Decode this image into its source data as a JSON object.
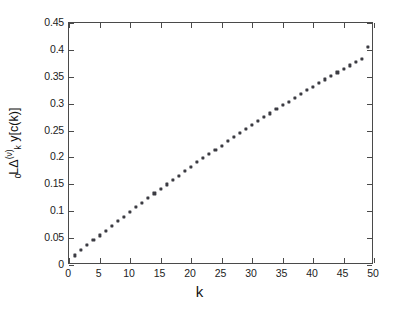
{
  "chart_data": {
    "type": "scatter",
    "title": "",
    "xlabel": "k",
    "ylabel": "L0 delta_k^(v) y[c(k)]",
    "ylabel_parts": {
      "pre_subscript": "0",
      "operator": "Δ",
      "operator_subscript": "k",
      "operator_superscript": "(ν)",
      "leading": "L",
      "function": "y[c(k)]"
    },
    "xlim": [
      0,
      50
    ],
    "ylim": [
      0,
      0.45
    ],
    "xticks": [
      0,
      5,
      10,
      15,
      20,
      25,
      30,
      35,
      40,
      45,
      50
    ],
    "xtick_labels": [
      "0",
      "5",
      "10",
      "15",
      "20",
      "25",
      "30",
      "35",
      "40",
      "45",
      "50"
    ],
    "yticks": [
      0,
      0.05,
      0.1,
      0.15,
      0.2,
      0.25,
      0.3,
      0.35,
      0.4,
      0.45
    ],
    "ytick_labels": [
      "0",
      "0.05",
      "0.1",
      "0.15",
      "0.2",
      "0.25",
      "0.3",
      "0.35",
      "0.4",
      "0.45"
    ],
    "grid": false,
    "legend": null,
    "marker_color": "#3b3b42",
    "marker_style": "square",
    "x": [
      1,
      2,
      3,
      4,
      5,
      6,
      7,
      8,
      9,
      10,
      11,
      12,
      13,
      14,
      15,
      16,
      17,
      18,
      19,
      20,
      21,
      22,
      23,
      24,
      25,
      26,
      27,
      28,
      29,
      30,
      31,
      32,
      33,
      34,
      35,
      36,
      37,
      38,
      39,
      40,
      41,
      42,
      43,
      44,
      45,
      46,
      47,
      48,
      49
    ],
    "y": [
      0.018,
      0.028,
      0.037,
      0.046,
      0.055,
      0.064,
      0.073,
      0.082,
      0.09,
      0.099,
      0.108,
      0.116,
      0.125,
      0.133,
      0.142,
      0.15,
      0.158,
      0.166,
      0.175,
      0.183,
      0.191,
      0.199,
      0.207,
      0.214,
      0.222,
      0.23,
      0.238,
      0.245,
      0.253,
      0.26,
      0.268,
      0.275,
      0.282,
      0.29,
      0.297,
      0.304,
      0.311,
      0.318,
      0.325,
      0.331,
      0.338,
      0.345,
      0.351,
      0.358,
      0.364,
      0.371,
      0.377,
      0.383,
      0.405
    ],
    "series": [
      {
        "name": "y[c(k)]",
        "values": [
          0.018,
          0.028,
          0.037,
          0.046,
          0.055,
          0.064,
          0.073,
          0.082,
          0.09,
          0.099,
          0.108,
          0.116,
          0.125,
          0.133,
          0.142,
          0.15,
          0.158,
          0.166,
          0.175,
          0.183,
          0.191,
          0.199,
          0.207,
          0.214,
          0.222,
          0.23,
          0.238,
          0.245,
          0.253,
          0.26,
          0.268,
          0.275,
          0.282,
          0.29,
          0.297,
          0.304,
          0.311,
          0.318,
          0.325,
          0.331,
          0.338,
          0.345,
          0.351,
          0.358,
          0.364,
          0.371,
          0.377,
          0.383,
          0.405
        ]
      }
    ]
  }
}
